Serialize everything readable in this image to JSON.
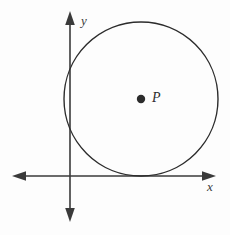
{
  "figure": {
    "background_color": "#fdfdfd",
    "width": 230,
    "height": 235,
    "stroke_color": "#3a3a3a",
    "circle_stroke_color": "#2c2c2c",
    "point_fill_color": "#2c2c2c"
  },
  "axes": {
    "x_axis": {
      "label": "x",
      "label_x": 211,
      "label_y": 188,
      "line_y": 176,
      "line_x_start": 12,
      "line_x_end": 216,
      "arrow_left": true,
      "arrow_right": true,
      "stroke_width": 1.6
    },
    "y_axis": {
      "label": "y",
      "label_x": 81,
      "label_y": 22,
      "line_x": 70,
      "line_y_start": 11,
      "line_y_end": 222,
      "arrow_up": true,
      "arrow_down": true,
      "stroke_width": 1.6
    },
    "origin": {
      "x": 70,
      "y": 176
    }
  },
  "shapes": {
    "circle": {
      "name": "circle",
      "center_x": 141,
      "center_y": 99,
      "radius": 77,
      "stroke_width": 1.4,
      "fill": "none",
      "tangent_to": "x-axis"
    },
    "point": {
      "name": "center-point-P",
      "label": "P",
      "cx": 141,
      "cy": 99,
      "r": 4.2,
      "label_x": 152,
      "label_y": 99
    }
  },
  "chart_data": {
    "type": "scatter",
    "xlabel": "x",
    "ylabel": "y",
    "grid": false,
    "legend": null,
    "annotations": [
      {
        "text": "P",
        "x": 141,
        "y": 99,
        "kind": "point-label"
      },
      {
        "text": "y",
        "x": 81,
        "y": 22,
        "kind": "axis-label"
      },
      {
        "text": "x",
        "x": 211,
        "y": 188,
        "kind": "axis-label"
      }
    ],
    "series": [
      {
        "name": "circle",
        "type": "circle",
        "center": [
          141,
          99
        ],
        "radius": 77,
        "filled": false
      },
      {
        "name": "center-point",
        "type": "point",
        "x": [
          141
        ],
        "y": [
          99
        ],
        "labels": [
          "P"
        ]
      }
    ]
  }
}
